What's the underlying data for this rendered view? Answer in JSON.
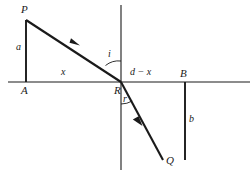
{
  "figure": {
    "stroke_color": "#1a1a1a",
    "background_color": "#ffffff",
    "points": {
      "P": {
        "label": "P",
        "x": 26,
        "y": 14
      },
      "A": {
        "label": "A",
        "x": 26,
        "y": 82
      },
      "R": {
        "label": "R",
        "x": 121,
        "y": 82
      },
      "B": {
        "label": "B",
        "x": 185,
        "y": 82
      },
      "Q": {
        "label": "Q",
        "x": 163,
        "y": 160
      }
    },
    "segment_labels": {
      "a": "a",
      "x": "x",
      "d_minus_x": "d − x",
      "b": "b"
    },
    "angle_labels": {
      "incidence": "i",
      "refraction": "r"
    },
    "axis": {
      "left_x": 8,
      "right_x": 250,
      "y": 82
    },
    "normal": {
      "x": 121,
      "top_y": 5,
      "bottom_y": 170
    },
    "rays": [
      {
        "name": "incident-ray",
        "from": "P",
        "to": "R",
        "arrow_at": [
          75,
          42
        ]
      },
      {
        "name": "refracted-ray",
        "from": "R",
        "to": "Q",
        "arrow_at": [
          138,
          120
        ]
      }
    ]
  }
}
